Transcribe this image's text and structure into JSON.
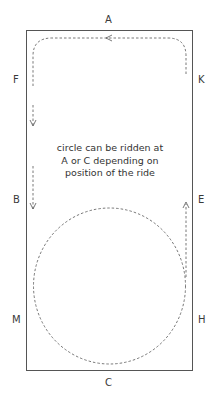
{
  "diagram": {
    "markers": {
      "top": "A",
      "bottom": "C",
      "left_upper": "F",
      "left_middle": "B",
      "left_lower": "M",
      "right_upper": "K",
      "right_middle": "E",
      "right_lower": "H"
    },
    "note_lines": [
      "circle can be ridden at",
      "A or C depending on",
      "position of the ride"
    ],
    "colors": {
      "arena_border": "#555555",
      "path": "#555555",
      "text": "#333333"
    }
  }
}
